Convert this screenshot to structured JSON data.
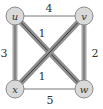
{
  "graph": {
    "nodes": [
      {
        "id": "u",
        "label": "u",
        "x": 15,
        "y": 16
      },
      {
        "id": "v",
        "label": "v",
        "x": 84,
        "y": 16
      },
      {
        "id": "x",
        "label": "x",
        "x": 15,
        "y": 89
      },
      {
        "id": "w",
        "label": "w",
        "x": 84,
        "y": 89
      }
    ],
    "edges": [
      {
        "from": "u",
        "to": "v",
        "weight": "4",
        "highlighted": false
      },
      {
        "from": "u",
        "to": "x",
        "weight": "3",
        "highlighted": true
      },
      {
        "from": "v",
        "to": "w",
        "weight": "2",
        "highlighted": true
      },
      {
        "from": "x",
        "to": "w",
        "weight": "5",
        "highlighted": false
      },
      {
        "from": "u",
        "to": "w",
        "weight": "1",
        "highlighted": true
      },
      {
        "from": "v",
        "to": "x",
        "weight": "1",
        "highlighted": true
      }
    ]
  },
  "colors": {
    "node_fill": "#d9d9d9",
    "node_stroke": "#8c8c8c",
    "highlight_edge": "#a6a6a6",
    "highlight_core": "#333333",
    "thin_edge": "#555555",
    "text": "#333333"
  }
}
